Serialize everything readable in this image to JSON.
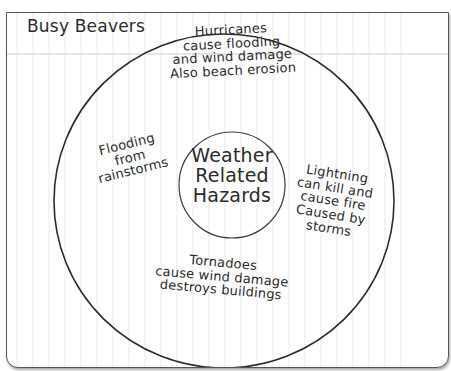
{
  "page": {
    "title": "Busy Beavers"
  },
  "diagram": {
    "type": "circle-map",
    "center": {
      "label": "Weather\nRelated\nHazards"
    },
    "items": [
      {
        "id": "hurricanes",
        "position": "top",
        "text": "Hurricanes\ncause flooding\nand wind damage\nAlso beach erosion"
      },
      {
        "id": "flooding",
        "position": "left",
        "text": "Flooding\nfrom\nrainstorms"
      },
      {
        "id": "lightning",
        "position": "right",
        "text": "Lightning\ncan kill and\ncause fire\nCaused by\nstorms"
      },
      {
        "id": "tornadoes",
        "position": "bottom",
        "text": "Tornadoes\ncause wind damage\ndestroys buildings"
      }
    ]
  },
  "colors": {
    "ink": "#2b2b2b",
    "grid": "#e6e6e6",
    "border": "#555555",
    "paper": "#ffffff"
  }
}
